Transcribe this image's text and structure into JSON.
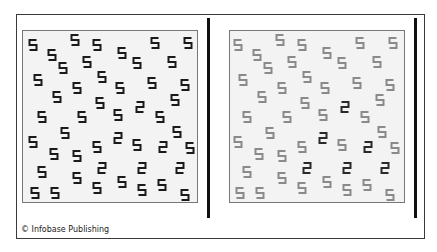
{
  "figure": {
    "credit": "© Infobase Publishing",
    "colors": {
      "frame": "#3a3a3a",
      "panel_bg": "#f3f3f3",
      "panel_border": "#777777",
      "left_five": "#1a1a1a",
      "left_two": "#1a1a1a",
      "right_five": "#8a8a8a",
      "right_two": "#2a2a2a",
      "bar": "#111111"
    },
    "right_offset_x": 205,
    "glyph_size": [
      9,
      11
    ],
    "glyphs": [
      {
        "d": "5",
        "x": 33,
        "y": 45
      },
      {
        "d": "5",
        "x": 75,
        "y": 40
      },
      {
        "d": "5",
        "x": 97,
        "y": 45
      },
      {
        "d": "5",
        "x": 155,
        "y": 43
      },
      {
        "d": "5",
        "x": 188,
        "y": 43
      },
      {
        "d": "5",
        "x": 52,
        "y": 55
      },
      {
        "d": "5",
        "x": 63,
        "y": 68
      },
      {
        "d": "5",
        "x": 87,
        "y": 62
      },
      {
        "d": "5",
        "x": 122,
        "y": 53
      },
      {
        "d": "5",
        "x": 137,
        "y": 63
      },
      {
        "d": "5",
        "x": 172,
        "y": 62
      },
      {
        "d": "5",
        "x": 38,
        "y": 80
      },
      {
        "d": "5",
        "x": 102,
        "y": 77
      },
      {
        "d": "5",
        "x": 152,
        "y": 83
      },
      {
        "d": "5",
        "x": 185,
        "y": 85
      },
      {
        "d": "5",
        "x": 57,
        "y": 97
      },
      {
        "d": "5",
        "x": 77,
        "y": 88
      },
      {
        "d": "5",
        "x": 120,
        "y": 88
      },
      {
        "d": "5",
        "x": 100,
        "y": 103
      },
      {
        "d": "5",
        "x": 118,
        "y": 115
      },
      {
        "d": "2",
        "x": 140,
        "y": 107
      },
      {
        "d": "5",
        "x": 160,
        "y": 117
      },
      {
        "d": "5",
        "x": 175,
        "y": 100
      },
      {
        "d": "5",
        "x": 42,
        "y": 117
      },
      {
        "d": "5",
        "x": 82,
        "y": 117
      },
      {
        "d": "5",
        "x": 33,
        "y": 142
      },
      {
        "d": "5",
        "x": 65,
        "y": 133
      },
      {
        "d": "5",
        "x": 54,
        "y": 154
      },
      {
        "d": "5",
        "x": 77,
        "y": 156
      },
      {
        "d": "5",
        "x": 97,
        "y": 147
      },
      {
        "d": "2",
        "x": 118,
        "y": 138
      },
      {
        "d": "5",
        "x": 137,
        "y": 145
      },
      {
        "d": "2",
        "x": 163,
        "y": 147
      },
      {
        "d": "5",
        "x": 177,
        "y": 132
      },
      {
        "d": "5",
        "x": 190,
        "y": 148
      },
      {
        "d": "5",
        "x": 42,
        "y": 172
      },
      {
        "d": "2",
        "x": 102,
        "y": 168
      },
      {
        "d": "2",
        "x": 142,
        "y": 168
      },
      {
        "d": "2",
        "x": 180,
        "y": 168
      },
      {
        "d": "5",
        "x": 77,
        "y": 178
      },
      {
        "d": "5",
        "x": 97,
        "y": 188
      },
      {
        "d": "5",
        "x": 122,
        "y": 182
      },
      {
        "d": "5",
        "x": 142,
        "y": 190
      },
      {
        "d": "5",
        "x": 162,
        "y": 185
      },
      {
        "d": "5",
        "x": 35,
        "y": 193
      },
      {
        "d": "5",
        "x": 55,
        "y": 193
      },
      {
        "d": "5",
        "x": 185,
        "y": 195
      }
    ]
  }
}
